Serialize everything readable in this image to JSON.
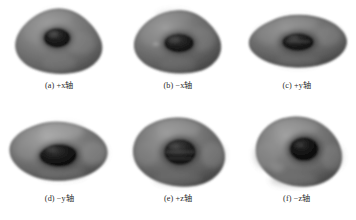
{
  "figure": {
    "type": "multi-panel-image-grid",
    "background_color": "#ffffff",
    "rows": 2,
    "columns": 3
  },
  "panels": [
    {
      "id": "a",
      "caption": "(a) +x轴",
      "label_prefix": "(a)",
      "sign": "+",
      "axis": "x",
      "axis_word": "轴",
      "view": "+x axis",
      "body_color": "#767676",
      "body_shadow_color": "#4a4a4a",
      "body_highlight_color": "#a6a6a6",
      "cavity_color": "#141414",
      "cavity_rim_color": "#3c3c3c",
      "outline_color": "#3a3a3a"
    },
    {
      "id": "b",
      "caption": "(b) −x轴",
      "label_prefix": "(b)",
      "sign": "−",
      "axis": "x",
      "axis_word": "轴",
      "view": "-x axis",
      "body_color": "#6f6f6f",
      "body_shadow_color": "#454545",
      "body_highlight_color": "#9e9e9e",
      "cavity_color": "#171717",
      "cavity_rim_color": "#3a3a3a",
      "outline_color": "#363636"
    },
    {
      "id": "c",
      "caption": "(c) +y轴",
      "label_prefix": "(c)",
      "sign": "+",
      "axis": "y",
      "axis_word": "轴",
      "view": "+y axis",
      "body_color": "#6b6b6b",
      "body_shadow_color": "#414141",
      "body_highlight_color": "#9b9b9b",
      "cavity_color": "#1a1a1a",
      "cavity_rim_color": "#393939",
      "outline_color": "#333333"
    },
    {
      "id": "d",
      "caption": "(d) −y轴",
      "label_prefix": "(d)",
      "sign": "−",
      "axis": "y",
      "axis_word": "轴",
      "view": "-y axis",
      "body_color": "#737373",
      "body_shadow_color": "#474747",
      "body_highlight_color": "#a8a8a8",
      "cavity_color": "#121212",
      "cavity_rim_color": "#383838",
      "outline_color": "#383838"
    },
    {
      "id": "e",
      "caption": "(e) +z轴",
      "label_prefix": "(e)",
      "sign": "+",
      "axis": "z",
      "axis_word": "轴",
      "view": "+z axis",
      "body_color": "#6d6d6d",
      "body_shadow_color": "#434343",
      "body_highlight_color": "#9c9c9c",
      "cavity_color": "#1c1c1c",
      "cavity_rim_color": "#3d3d3d",
      "outline_color": "#343434"
    },
    {
      "id": "f",
      "caption": "(f) −z轴",
      "label_prefix": "(f)",
      "sign": "−",
      "axis": "z",
      "axis_word": "轴",
      "view": "-z axis",
      "body_color": "#717171",
      "body_shadow_color": "#464646",
      "body_highlight_color": "#a3a3a3",
      "cavity_color": "#101010",
      "cavity_rim_color": "#343434",
      "outline_color": "#373737"
    }
  ]
}
